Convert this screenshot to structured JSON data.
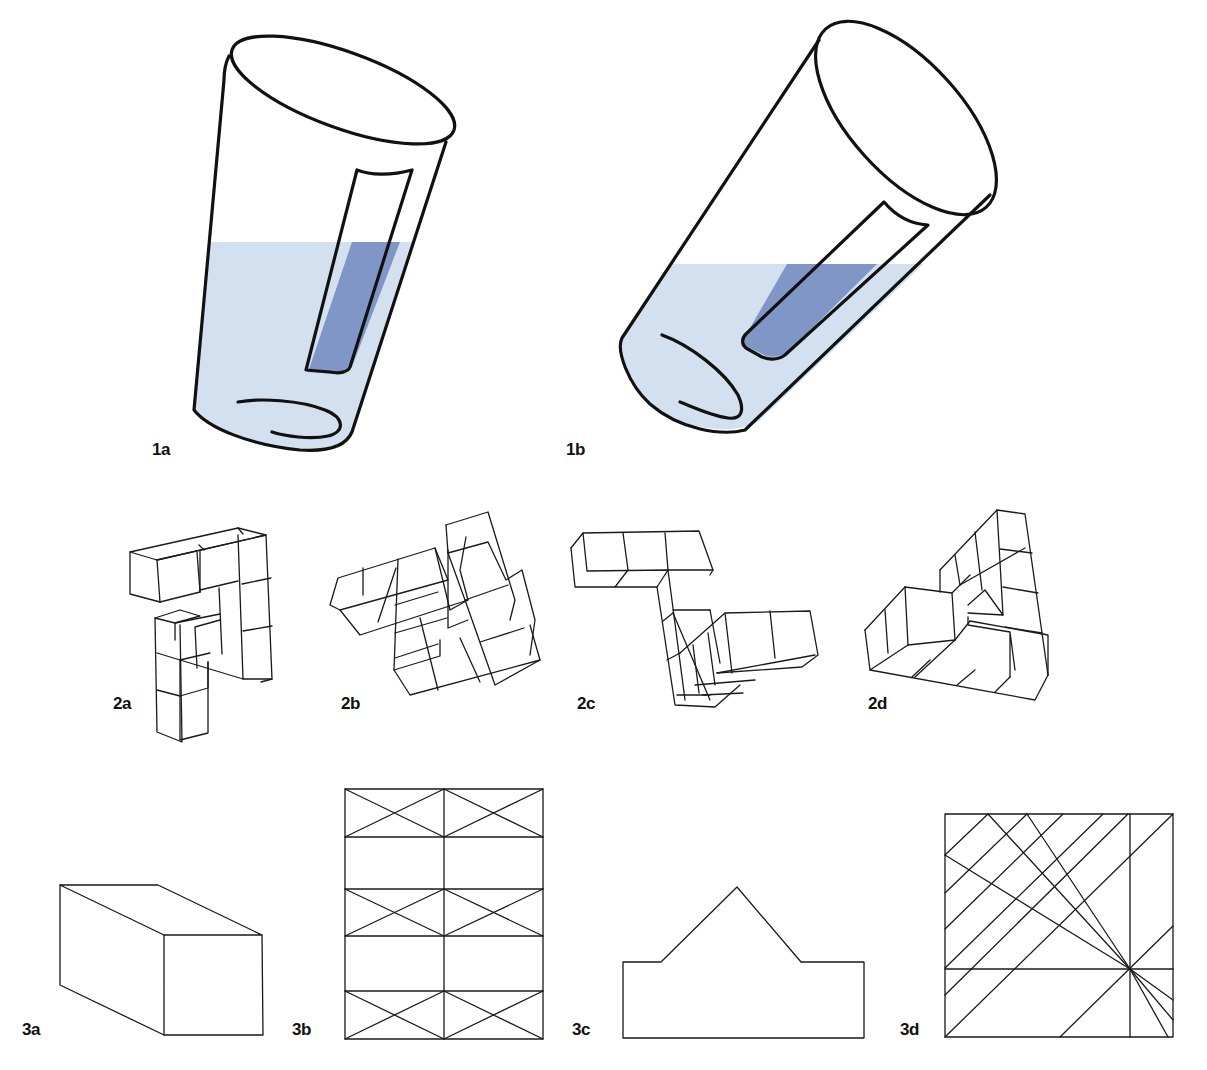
{
  "figure": {
    "colors": {
      "stroke": "#111111",
      "water_light": "#d3e0ef",
      "water_dark": "#7f96c6",
      "background": "#ffffff"
    },
    "row1": {
      "panels": [
        {
          "id": "1a",
          "label": "1a",
          "subject": "tilted glass with inner tube, partially filled with water"
        },
        {
          "id": "1b",
          "label": "1b",
          "subject": "glass tilted further with inner tube, water level horizontal"
        }
      ]
    },
    "row2": {
      "panels": [
        {
          "id": "2a",
          "label": "2a",
          "subject": "3D cube assembly"
        },
        {
          "id": "2b",
          "label": "2b",
          "subject": "3D cube assembly rotated"
        },
        {
          "id": "2c",
          "label": "2c",
          "subject": "3D cube assembly (Z-shape)"
        },
        {
          "id": "2d",
          "label": "2d",
          "subject": "3D cube assembly"
        }
      ]
    },
    "row3": {
      "panels": [
        {
          "id": "3a",
          "label": "3a",
          "subject": "rectangular box (oblique projection)"
        },
        {
          "id": "3b",
          "label": "3b",
          "subject": "grid of rectangles with X braces"
        },
        {
          "id": "3c",
          "label": "3c",
          "subject": "rectangle with triangular peak outline"
        },
        {
          "id": "3d",
          "label": "3d",
          "subject": "square with diagonal line pattern"
        }
      ]
    }
  }
}
